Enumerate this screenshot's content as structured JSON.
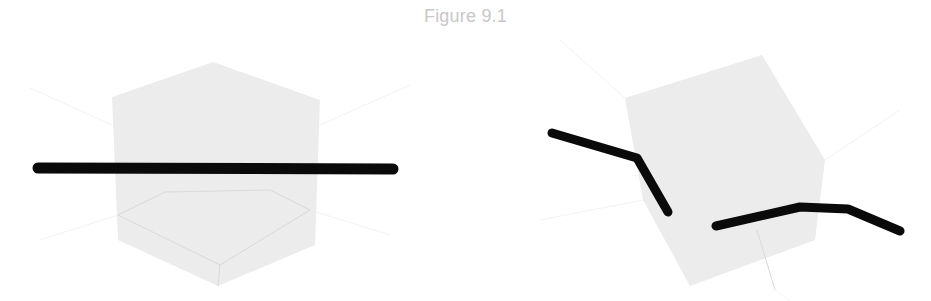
{
  "figure": {
    "title": "Figure 9.1"
  },
  "colors": {
    "background": "#ffffff",
    "cube_fill": "#ececec",
    "cube_edge": "#d9d9d9",
    "axis_line": "#f2f2f2",
    "rod": "#0a0a0a",
    "title": "#c8c8c8"
  },
  "panels": [
    {
      "name": "left-panel",
      "description": "Translucent cube with straight rod passing horizontally through it",
      "cube": {
        "silhouette": [
          [
            213,
            62
          ],
          [
            320,
            100
          ],
          [
            315,
            245
          ],
          [
            218,
            286
          ],
          [
            118,
            240
          ],
          [
            112,
            97
          ]
        ],
        "inner_edges": [
          [
            [
              118,
              215
            ],
            [
              165,
              192
            ]
          ],
          [
            [
              165,
              192
            ],
            [
              270,
              190
            ]
          ],
          [
            [
              270,
              190
            ],
            [
              310,
              210
            ]
          ],
          [
            [
              118,
              215
            ],
            [
              220,
              265
            ]
          ],
          [
            [
              220,
              265
            ],
            [
              310,
              210
            ]
          ],
          [
            [
              220,
              265
            ],
            [
              218,
              286
            ]
          ]
        ]
      },
      "rods": [
        {
          "points": [
            [
              38,
              168
            ],
            [
              393,
              169
            ]
          ],
          "width": 11
        }
      ]
    },
    {
      "name": "right-panel",
      "description": "Rotated translucent cube with bent rod segments",
      "cube": {
        "silhouette": [
          [
            625,
            98
          ],
          [
            762,
            55
          ],
          [
            825,
            160
          ],
          [
            815,
            240
          ],
          [
            690,
            286
          ],
          [
            643,
            200
          ]
        ],
        "inner_edges": [
          [
            [
              757,
              230
            ],
            [
              775,
              290
            ]
          ]
        ]
      },
      "rods": [
        {
          "points": [
            [
              552,
              133
            ],
            [
              637,
              158
            ],
            [
              668,
              212
            ]
          ],
          "width": 9
        },
        {
          "points": [
            [
              716,
              226
            ],
            [
              800,
              207
            ],
            [
              848,
              209
            ],
            [
              900,
              231
            ]
          ],
          "width": 9
        }
      ]
    }
  ]
}
